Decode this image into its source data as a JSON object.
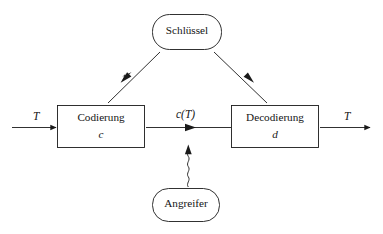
{
  "diagram": {
    "language": "de",
    "background_color": "#ffffff",
    "stroke_color": "#1a1a1a",
    "text_color": "#141414",
    "nodes": [
      {
        "id": "schluessel",
        "shape": "rounded-rectangle",
        "label": "Schlüssel",
        "sub": "",
        "x": 152,
        "y": 14,
        "w": 70,
        "h": 36,
        "radius": 17
      },
      {
        "id": "codierung",
        "shape": "rectangle",
        "label": "Codierung",
        "sub": "c",
        "x": 57,
        "y": 105,
        "w": 88,
        "h": 43,
        "radius": 0
      },
      {
        "id": "decodierung",
        "shape": "rectangle",
        "label": "Decodierung",
        "sub": "d",
        "x": 231,
        "y": 105,
        "w": 88,
        "h": 43,
        "radius": 0
      },
      {
        "id": "angreifer",
        "shape": "rounded-rectangle",
        "label": "Angreifer",
        "sub": "",
        "x": 152,
        "y": 188,
        "w": 68,
        "h": 34,
        "radius": 16
      }
    ],
    "edges": [
      {
        "id": "input-plaintext",
        "from": "",
        "to": "codierung",
        "label": "T",
        "label_x": 33,
        "label_y": 110,
        "style": "straight",
        "arrow": "end"
      },
      {
        "id": "ciphertext",
        "from": "codierung",
        "to": "decodierung",
        "label": "c(T)",
        "label_x": 176,
        "label_y": 108,
        "style": "straight",
        "arrow": "mid"
      },
      {
        "id": "output-plaintext",
        "from": "decodierung",
        "to": "",
        "label": "T",
        "label_x": 344,
        "label_y": 110,
        "style": "straight",
        "arrow": "end"
      },
      {
        "id": "key-to-codierung",
        "from": "schluessel",
        "to": "codierung",
        "label": "",
        "style": "diagonal",
        "arrow": "mid"
      },
      {
        "id": "key-to-decodierung",
        "from": "schluessel",
        "to": "decodierung",
        "label": "",
        "style": "diagonal",
        "arrow": "mid"
      },
      {
        "id": "angreifer-to-ciphertext",
        "from": "angreifer",
        "to": "ciphertext",
        "label": "",
        "style": "squiggly",
        "arrow": "end"
      }
    ]
  }
}
